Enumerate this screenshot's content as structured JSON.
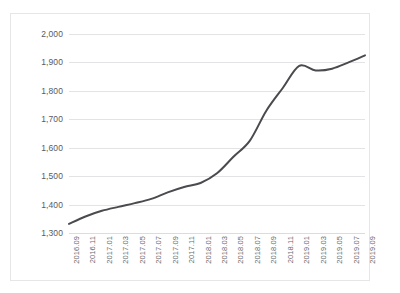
{
  "clipped_header": {
    "fragments": [
      "——",
      "··",
      "—",
      "··",
      "——",
      "· · ·"
    ]
  },
  "chart_data": {
    "type": "line",
    "title": "",
    "subtitle": "",
    "xlabel": "",
    "ylabel": "",
    "ylim": [
      1300,
      2000
    ],
    "ytick_step": 100,
    "ytick_labels": [
      "2,000",
      "1,900",
      "1,800",
      "1,700",
      "1,600",
      "1,500",
      "1,400",
      "1,300"
    ],
    "ytick_values": [
      2000,
      1900,
      1800,
      1700,
      1600,
      1500,
      1400,
      1300
    ],
    "grid": true,
    "grid_axis": "y",
    "legend": false,
    "legend_position": "none",
    "line_color": "#4a4a4f",
    "line_width": 2.0,
    "markers": false,
    "smooth": true,
    "categories": [
      "2016.09",
      "2016.11",
      "2017.01",
      "2017.03",
      "2017.05",
      "2017.07",
      "2017.09",
      "2017.11",
      "2018.01",
      "2018.03",
      "2018.05",
      "2018.07",
      "2018.09",
      "2018.11",
      "2019.01",
      "2019.03",
      "2019.05",
      "2019.07",
      "2019.09"
    ],
    "values": [
      1332,
      1358,
      1378,
      1392,
      1405,
      1420,
      1443,
      1462,
      1476,
      1510,
      1568,
      1625,
      1730,
      1810,
      1888,
      1872,
      1878,
      1900,
      1925
    ],
    "series": [
      {
        "name": "series-1",
        "color": "#4a4a4f",
        "values": [
          1332,
          1358,
          1378,
          1392,
          1405,
          1420,
          1443,
          1462,
          1476,
          1510,
          1568,
          1625,
          1730,
          1810,
          1888,
          1872,
          1878,
          1900,
          1925
        ]
      }
    ]
  }
}
